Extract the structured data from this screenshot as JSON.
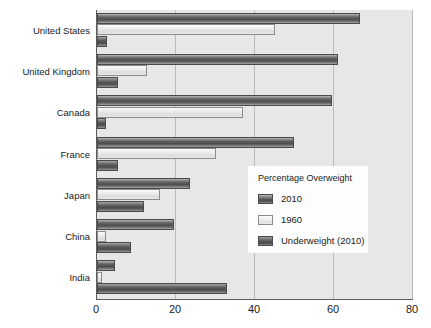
{
  "chart_data": {
    "type": "bar",
    "orientation": "horizontal",
    "title": "",
    "xlabel": "",
    "ylabel": "",
    "xlim": [
      0,
      80
    ],
    "xticks": [
      0,
      20,
      40,
      60,
      80
    ],
    "xtick_labels": [
      "0",
      "20",
      "40",
      "60",
      "80"
    ],
    "grid": true,
    "grid_axis": "x",
    "legend_position": "center-right",
    "legend_title": "Percentage Overweight",
    "categories": [
      "United States",
      "United Kingdom",
      "Canada",
      "France",
      "Japan",
      "China",
      "India"
    ],
    "series": [
      {
        "name": "2010",
        "color": "#5a5a5a",
        "values": [
          66.7,
          61.0,
          59.5,
          49.8,
          23.5,
          19.5,
          4.5
        ]
      },
      {
        "name": "1960",
        "color": "#e8e8e8",
        "values": [
          45.0,
          12.6,
          37.0,
          30.0,
          16.0,
          2.3,
          1.3
        ]
      },
      {
        "name": "Underweight (2010)",
        "color": "#555555",
        "values": [
          2.5,
          5.3,
          2.3,
          5.3,
          12.0,
          8.6,
          33.0
        ]
      }
    ]
  },
  "colors": {
    "plot_background": "#e7e7e7",
    "page_background": "#ffffff",
    "axis": "#5d5d5d",
    "gridline": "#b9b9b9",
    "legend_background": "#fdfdfd",
    "text": "#1a1a1a"
  }
}
